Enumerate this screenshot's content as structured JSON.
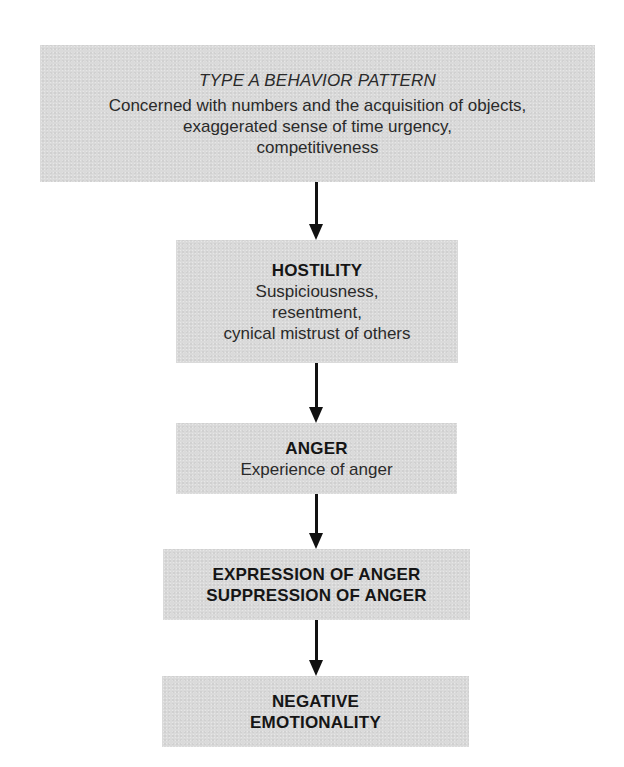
{
  "diagram": {
    "type": "flowchart",
    "direction": "top-to-bottom",
    "colors": {
      "box_fill": "#dadada",
      "text": "#1c1c1c",
      "arrow": "#111111",
      "background": "#ffffff"
    },
    "nodes": [
      {
        "id": "type-a",
        "title": "TYPE A BEHAVIOR PATTERN",
        "title_style": "italic",
        "description_lines": [
          "Concerned with numbers and the acquisition of objects,",
          "exaggerated sense of time urgency,",
          "competitiveness"
        ]
      },
      {
        "id": "hostility",
        "title": "HOSTILITY",
        "title_style": "bold",
        "description_lines": [
          "Suspiciousness,",
          "resentment,",
          "cynical mistrust of others"
        ]
      },
      {
        "id": "anger",
        "title": "ANGER",
        "title_style": "bold",
        "description_lines": [
          "Experience of anger"
        ]
      },
      {
        "id": "expression-suppression",
        "title_lines": [
          "EXPRESSION OF ANGER",
          "SUPPRESSION OF ANGER"
        ],
        "title_style": "bold"
      },
      {
        "id": "negative-emotionality",
        "title_lines": [
          "NEGATIVE",
          "EMOTIONALITY"
        ],
        "title_style": "bold"
      }
    ],
    "edges": [
      {
        "from": "type-a",
        "to": "hostility"
      },
      {
        "from": "hostility",
        "to": "anger"
      },
      {
        "from": "anger",
        "to": "expression-suppression"
      },
      {
        "from": "expression-suppression",
        "to": "negative-emotionality"
      }
    ]
  }
}
